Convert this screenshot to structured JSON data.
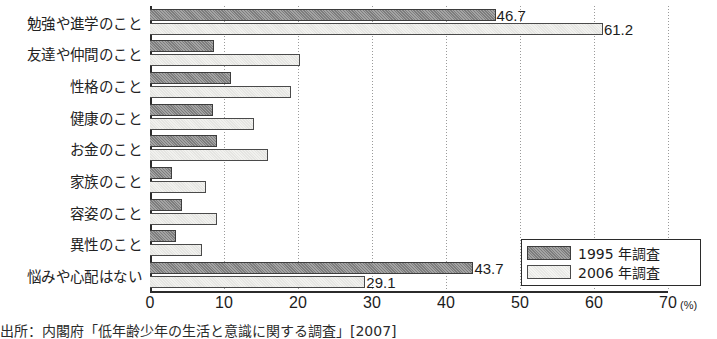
{
  "chart_data": {
    "type": "bar",
    "orientation": "horizontal",
    "title": "",
    "xlabel": "(%)",
    "ylabel": "",
    "xlim": [
      0,
      70
    ],
    "xticks": [
      0,
      10,
      20,
      30,
      40,
      50,
      60,
      70
    ],
    "grid": true,
    "legend_position": "bottom-right",
    "categories": [
      "勉強や進学のこと",
      "友達や仲間のこと",
      "性格のこと",
      "健康のこと",
      "お金のこと",
      "家族のこと",
      "容姿のこと",
      "異性のこと",
      "悩みや心配はない"
    ],
    "series": [
      {
        "name": "1995 年調査",
        "color": "#7d7d7d",
        "values": [
          46.7,
          8.7,
          11.0,
          8.5,
          9.0,
          3.0,
          4.3,
          3.5,
          43.7
        ],
        "labels": [
          "46.7",
          "",
          "",
          "",
          "",
          "",
          "",
          "",
          "43.7"
        ]
      },
      {
        "name": "2006 年調査",
        "color": "#f1f1ee",
        "values": [
          61.2,
          20.3,
          19.0,
          14.0,
          16.0,
          7.5,
          9.0,
          7.0,
          29.1
        ],
        "labels": [
          "61.2",
          "",
          "",
          "",
          "",
          "",
          "",
          "",
          "29.1"
        ]
      }
    ]
  },
  "axis": {
    "unit_label": "(%)"
  },
  "legend": {
    "items": [
      {
        "label": "1995 年調査",
        "swatch": "s1995"
      },
      {
        "label": "2006 年調査",
        "swatch": "s2006"
      }
    ]
  },
  "source": {
    "text": "出所：内閣府「低年齢少年の生活と意識に関する調査」[2007]"
  }
}
